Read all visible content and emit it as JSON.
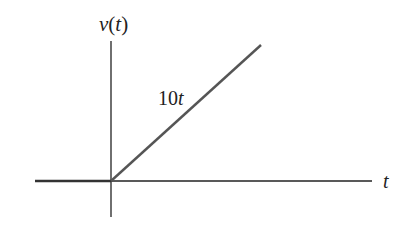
{
  "diagram": {
    "y_axis_label": "v(t)",
    "x_axis_label": "t",
    "segment_label": "10t",
    "signal": {
      "description": "v(t) = 0 for t < 0, v(t) = 10t for t >= 0",
      "slope": 10,
      "segments": [
        {
          "name": "zero-for-negative-t",
          "expression": "0",
          "domain": "t < 0"
        },
        {
          "name": "ramp",
          "expression": "10t",
          "domain": "t >= 0"
        }
      ]
    },
    "colors": {
      "axis": "#222222",
      "signal": "#555555",
      "text": "#222222"
    }
  }
}
